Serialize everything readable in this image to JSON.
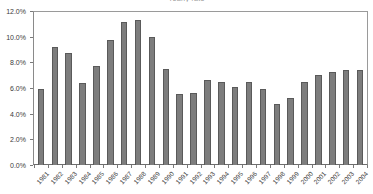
{
  "chart_data": {
    "type": "bar",
    "title": "Yearly rate",
    "xlabel": "",
    "ylabel": "",
    "ylim": [
      0,
      12
    ],
    "ytick_labels": [
      "0.0%",
      "2.0%",
      "4.0%",
      "6.0%",
      "8.0%",
      "10.0%",
      "12.0%"
    ],
    "ytick_values": [
      0,
      2,
      4,
      6,
      8,
      10,
      12
    ],
    "grid": false,
    "legend": false,
    "bar_color": "#7d7d7d",
    "bar_edge_color": "#5a5a5a",
    "plot_background": "#ffffff",
    "axis_color": "#9a9a9a",
    "categories": [
      "1981",
      "1982",
      "1983",
      "1984",
      "1985",
      "1986",
      "1987",
      "1988",
      "1989",
      "1990",
      "1991",
      "1992",
      "1993",
      "1994",
      "1995",
      "1996",
      "1997",
      "1998",
      "1999",
      "2000",
      "2001",
      "2002",
      "2003",
      "2004"
    ],
    "values": [
      5.9,
      9.2,
      8.75,
      6.4,
      7.7,
      9.75,
      11.15,
      11.3,
      9.95,
      7.45,
      5.5,
      5.65,
      6.6,
      6.5,
      6.1,
      6.45,
      5.9,
      4.75,
      5.25,
      6.5,
      7.0,
      7.25,
      7.4,
      7.4
    ]
  }
}
